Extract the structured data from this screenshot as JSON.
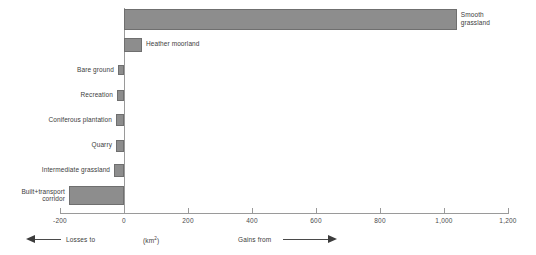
{
  "chart_data": {
    "type": "bar",
    "orientation": "horizontal",
    "title": "",
    "xlabel": "(km2)",
    "ylabel": "",
    "xlim": [
      -200,
      1200
    ],
    "xticks": [
      -200,
      0,
      200,
      400,
      600,
      800,
      1000,
      1200
    ],
    "xtick_labels": [
      "-200",
      "0",
      "200",
      "400",
      "600",
      "800",
      "1,000",
      "1,200"
    ],
    "grid": false,
    "legend": null,
    "categories": [
      "Smooth grassland",
      "Heather moorland",
      "Bare ground",
      "Recreation",
      "Coniferous plantation",
      "Quarry",
      "Intermediate grassland",
      "Built+transport corridor"
    ],
    "values": [
      1040,
      56,
      -19,
      -22,
      -25,
      -25,
      -31,
      -172
    ],
    "bars": [
      {
        "label": "Smooth\ngrassland",
        "value": 1040,
        "label_side": "right"
      },
      {
        "label": "Heather moorland",
        "value": 56,
        "label_side": "right"
      },
      {
        "label": "Bare ground",
        "value": -19,
        "label_side": "left"
      },
      {
        "label": "Recreation",
        "value": -22,
        "label_side": "left"
      },
      {
        "label": "Coniferous plantation",
        "value": -25,
        "label_side": "left"
      },
      {
        "label": "Quarry",
        "value": -25,
        "label_side": "left"
      },
      {
        "label": "Intermediate grassland",
        "value": -31,
        "label_side": "left"
      },
      {
        "label": "Built+transport\ncorridor",
        "value": -172,
        "label_side": "left"
      }
    ],
    "annotations": {
      "losses": "Losses to",
      "units": "(km",
      "units_sup": "2",
      "units_close": ")",
      "gains": "Gains from"
    },
    "colors": {
      "bar_fill": "#8d8d8d",
      "bar_stroke": "#6f6f6f",
      "axis": "#9a9a9a",
      "text": "#3c3c3c",
      "background": "#ffffff"
    }
  }
}
